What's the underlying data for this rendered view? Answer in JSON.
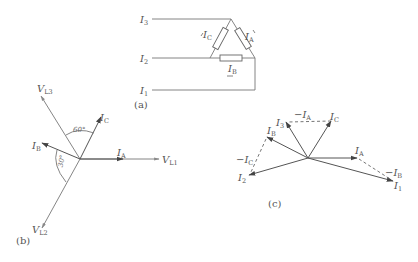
{
  "panel_a": {
    "caption": "(a)",
    "lines": [
      {
        "label": "I",
        "sub": "3"
      },
      {
        "label": "I",
        "sub": "2"
      },
      {
        "label": "I",
        "sub": "1"
      }
    ],
    "resistors": [
      {
        "label": "I",
        "sub": "C"
      },
      {
        "label": "I",
        "sub": "A"
      },
      {
        "label": "I",
        "sub": "B"
      }
    ]
  },
  "panel_b": {
    "caption": "(b)",
    "vectors": [
      {
        "label": "V",
        "sub": "L1"
      },
      {
        "label": "V",
        "sub": "L2"
      },
      {
        "label": "V",
        "sub": "L3"
      },
      {
        "label": "I",
        "sub": "A"
      },
      {
        "label": "I",
        "sub": "B"
      },
      {
        "label": "I",
        "sub": "C"
      }
    ],
    "angles": [
      "60°",
      "30°"
    ]
  },
  "panel_c": {
    "caption": "(c)",
    "vectors": [
      {
        "label": "I",
        "sub": "A"
      },
      {
        "label": "I",
        "sub": "B"
      },
      {
        "label": "I",
        "sub": "C"
      },
      {
        "label": "I",
        "sub": "1"
      },
      {
        "label": "I",
        "sub": "2"
      },
      {
        "label": "I",
        "sub": "3"
      },
      {
        "label": "−I",
        "sub": "A"
      },
      {
        "label": "−I",
        "sub": "B"
      },
      {
        "label": "−I",
        "sub": "C"
      }
    ]
  }
}
